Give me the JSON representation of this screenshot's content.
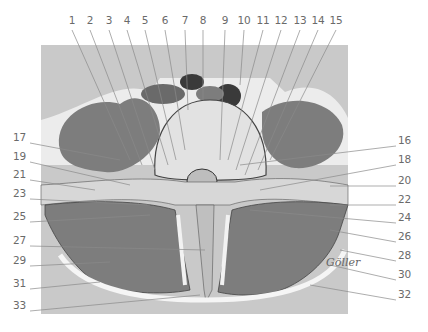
{
  "figure": {
    "kind": "anatomical cross-section illustration",
    "colors": {
      "background": "#ffffff",
      "panel": "#c9c9c9",
      "fascia_light": "#ececec",
      "muscle": "#7d7d7d",
      "muscle_dark": "#5e5e5e",
      "bone": "#dcdcdc",
      "vessel": "#3a3a3a",
      "leader_line": "#8a8a8a",
      "label_text": "#6a6a6a"
    },
    "signature": "Göller"
  },
  "labels": {
    "top": [
      {
        "n": "1",
        "x": 72
      },
      {
        "n": "2",
        "x": 90
      },
      {
        "n": "3",
        "x": 109
      },
      {
        "n": "4",
        "x": 127
      },
      {
        "n": "5",
        "x": 145
      },
      {
        "n": "6",
        "x": 165
      },
      {
        "n": "7",
        "x": 185
      },
      {
        "n": "8",
        "x": 203
      },
      {
        "n": "9",
        "x": 225
      },
      {
        "n": "10",
        "x": 244
      },
      {
        "n": "11",
        "x": 263
      },
      {
        "n": "12",
        "x": 281
      },
      {
        "n": "13",
        "x": 300
      },
      {
        "n": "14",
        "x": 318
      },
      {
        "n": "15",
        "x": 336
      }
    ],
    "left": [
      {
        "n": "17",
        "y": 137
      },
      {
        "n": "19",
        "y": 156
      },
      {
        "n": "21",
        "y": 174
      },
      {
        "n": "23",
        "y": 193
      },
      {
        "n": "25",
        "y": 216
      },
      {
        "n": "27",
        "y": 240
      },
      {
        "n": "29",
        "y": 260
      },
      {
        "n": "31",
        "y": 283
      },
      {
        "n": "33",
        "y": 305
      }
    ],
    "right": [
      {
        "n": "16",
        "y": 140
      },
      {
        "n": "18",
        "y": 159
      },
      {
        "n": "20",
        "y": 180
      },
      {
        "n": "22",
        "y": 199
      },
      {
        "n": "24",
        "y": 217
      },
      {
        "n": "26",
        "y": 236
      },
      {
        "n": "28",
        "y": 255
      },
      {
        "n": "30",
        "y": 274
      },
      {
        "n": "32",
        "y": 294
      }
    ]
  }
}
